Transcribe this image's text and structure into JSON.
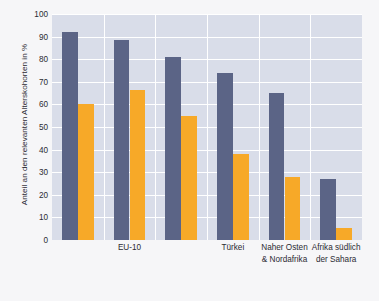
{
  "chart_data": {
    "type": "bar",
    "title": "",
    "subtitle": "",
    "xlabel": "",
    "ylabel": "Anteil an den relevanten Alterskohorten in %",
    "ylim": [
      0,
      100
    ],
    "ytick_step": 10,
    "yticks": [
      0,
      10,
      20,
      30,
      40,
      50,
      60,
      70,
      80,
      90,
      100
    ],
    "ytick_labels": [
      "0",
      "10",
      "20",
      "30",
      "40",
      "50",
      "60",
      "70",
      "80",
      "90",
      "100"
    ],
    "grid": true,
    "grid_orientation": "both",
    "legend": null,
    "legend_position": "none",
    "categories": [
      "",
      "EU-10",
      "",
      "Türkei",
      "Naher Osten\n& Nordafrika",
      "Afrika südlich\nder Sahara"
    ],
    "category_labels": [
      {
        "line1": "",
        "line2": ""
      },
      {
        "line1": "EU-10",
        "line2": ""
      },
      {
        "line1": "",
        "line2": ""
      },
      {
        "line1": "Türkei",
        "line2": ""
      },
      {
        "line1": "Naher Osten",
        "line2": "& Nordafrika"
      },
      {
        "line1": "Afrika südlich",
        "line2": "der Sahara"
      }
    ],
    "series": [
      {
        "name": "series-1",
        "color": "#5b6486",
        "values": [
          92,
          88.5,
          81,
          74,
          65,
          27
        ]
      },
      {
        "name": "series-2",
        "color": "#f7a928",
        "values": [
          60,
          66.5,
          55,
          38,
          28,
          5.5
        ]
      }
    ],
    "colors": {
      "series_1": "#5b6486",
      "series_2": "#f7a928",
      "plot_background": "#d9dde9",
      "page_background": "#f6f6f8",
      "gridline": "#ffffff",
      "text": "#2b2b33"
    }
  }
}
